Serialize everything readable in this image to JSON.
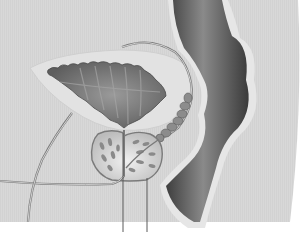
{
  "figure": {
    "type": "anatomical-illustration",
    "style": "grayscale",
    "labels": [],
    "leader_lines": [
      {
        "id": "line-1",
        "x": 123,
        "y_top": 133,
        "y_bottom": 232
      },
      {
        "id": "line-2",
        "x": 147,
        "y_top": 178,
        "y_bottom": 232
      }
    ],
    "structures": [
      {
        "name": "bladder"
      },
      {
        "name": "prostate"
      },
      {
        "name": "seminal-vesicle"
      },
      {
        "name": "vas-deferens"
      },
      {
        "name": "urethra"
      },
      {
        "name": "rectum"
      }
    ],
    "colors": {
      "background": "#d9d9d9",
      "body_outline_bg": "#ffffff",
      "bladder_outer": "#e4e4e4",
      "bladder_inner": "#7a7a7a",
      "rectum": "#5a5a5a",
      "prostate": "#cfcfcf",
      "lines": "#6a6a6a"
    }
  }
}
